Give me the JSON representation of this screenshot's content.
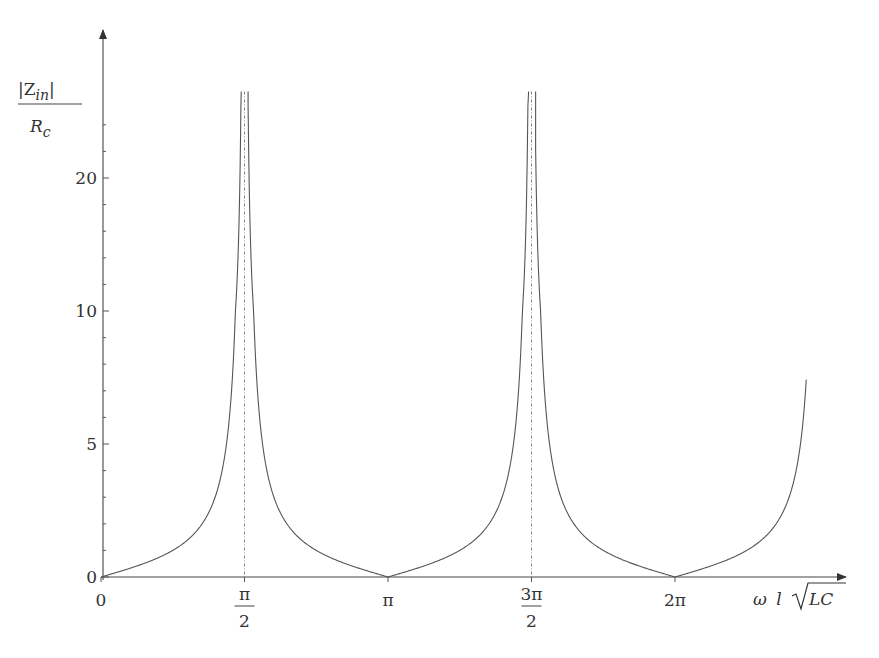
{
  "chart_data": {
    "type": "line",
    "title": "",
    "function": "|tan(x)|",
    "xlabel": "ω l √LC",
    "ylabel": "|Z_in| / R_c",
    "ylabel_parts": {
      "numerator": "|Z",
      "numerator_sub": "in",
      "numerator_close": "|",
      "denominator": "R",
      "denominator_sub": "c"
    },
    "xlabel_parts": {
      "omega": "ω",
      "l": "l",
      "sqrt_arg": "LC"
    },
    "x_ticks": [
      {
        "value": 0,
        "label": "0"
      },
      {
        "value": 1.5708,
        "label_num": "π",
        "label_den": "2"
      },
      {
        "value": 3.1416,
        "label": "π"
      },
      {
        "value": 4.7124,
        "label_num": "3π",
        "label_den": "2"
      },
      {
        "value": 6.2832,
        "label": "2π"
      }
    ],
    "y_ticks": [
      {
        "value": 0,
        "label": "0"
      },
      {
        "value": 5,
        "label": "5"
      },
      {
        "value": 10,
        "label": "10"
      },
      {
        "value": 20,
        "label": "20"
      }
    ],
    "y_scale": "piecewise-linear (0–5, 5–10, 10–20 equal spacing)",
    "asymptotes_x": [
      1.5708,
      4.7124
    ],
    "xlim": [
      0,
      7.72
    ],
    "ylim": [
      0,
      26.5
    ],
    "x": [
      0,
      0.3927,
      0.7854,
      1.1781,
      1.3744,
      1.4726,
      1.5328,
      1.6088,
      1.669,
      1.7671,
      1.9635,
      2.3562,
      2.7489,
      3.1416,
      3.5343,
      3.927,
      4.3197,
      4.516,
      4.6142,
      4.6744,
      4.7504,
      4.8106,
      4.9087,
      5.1051,
      5.4978,
      5.8905,
      6.2832,
      6.6759,
      7.0686,
      7.4613,
      7.719
    ],
    "values": [
      0,
      0.41,
      1.0,
      2.41,
      5.03,
      10.15,
      26.4,
      26.4,
      10.15,
      5.03,
      2.41,
      1.0,
      0.41,
      0,
      0.41,
      1.0,
      2.41,
      5.03,
      10.15,
      26.4,
      26.4,
      10.15,
      5.03,
      2.41,
      1.0,
      0.41,
      0,
      0.41,
      1.0,
      2.41,
      7.5
    ],
    "grid": false,
    "legend": null
  }
}
